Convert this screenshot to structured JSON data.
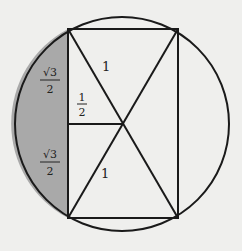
{
  "colors": {
    "background": "#efefed",
    "stroke": "#1a1a1a",
    "shade": "#a9a9a9"
  },
  "geometry": {
    "circle": {
      "cx": 122,
      "cy": 124,
      "r": 107
    },
    "rectangle": {
      "left": 68,
      "top": 29,
      "right": 178,
      "bottom": 218
    },
    "center_point": {
      "x": 123,
      "y": 124
    }
  },
  "labels": {
    "top_left_chord": {
      "numerator": "√3",
      "denominator": "2"
    },
    "bottom_left_chord": {
      "numerator": "√3",
      "denominator": "2"
    },
    "half_segment": {
      "numerator": "1",
      "denominator": "2"
    },
    "upper_diagonal": "1",
    "lower_diagonal": "1"
  }
}
